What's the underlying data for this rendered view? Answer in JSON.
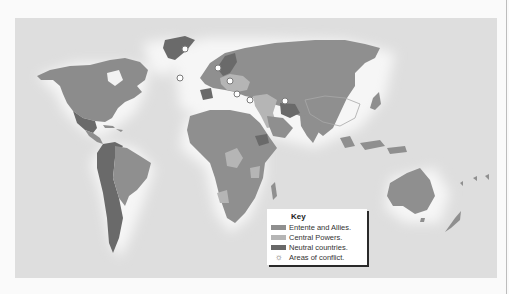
{
  "map": {
    "title": "World War I alliances map",
    "colors": {
      "ocean": "#e6e6e6",
      "glow": "#f7f7f7",
      "entente": "#8f8f8f",
      "central": "#b0b0b0",
      "neutral": "#6a6a6a",
      "border": "#a8a8a8"
    },
    "conflict_markers": [
      {
        "x": 170,
        "y": 31
      },
      {
        "x": 165,
        "y": 60
      },
      {
        "x": 203,
        "y": 50
      },
      {
        "x": 215,
        "y": 63
      },
      {
        "x": 222,
        "y": 76
      },
      {
        "x": 235,
        "y": 82
      },
      {
        "x": 270,
        "y": 83
      }
    ]
  },
  "key": {
    "title": "Key",
    "items": [
      {
        "label": "Entente and Allies.",
        "color": "#8f8f8f",
        "type": "swatch"
      },
      {
        "label": "Central Powers.",
        "color": "#b5b5b5",
        "type": "swatch"
      },
      {
        "label": "Neutral countries.",
        "color": "#686868",
        "type": "swatch"
      },
      {
        "label": "Areas of conflict.",
        "type": "marker",
        "glyph": "☼"
      }
    ]
  }
}
